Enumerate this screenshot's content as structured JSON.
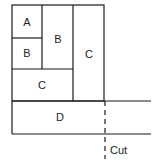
{
  "diagram": {
    "colors": {
      "line": "#1a1a1a",
      "background": "#ffffff"
    },
    "regions": [
      {
        "id": "A",
        "label": "A",
        "x": 12,
        "y": 5,
        "w": 30,
        "h": 33
      },
      {
        "id": "B1",
        "label": "B",
        "x": 12,
        "y": 38,
        "w": 30,
        "h": 31
      },
      {
        "id": "B2",
        "label": "B",
        "x": 42,
        "y": 5,
        "w": 31,
        "h": 64
      },
      {
        "id": "C1",
        "label": "C",
        "x": 12,
        "y": 69,
        "w": 61,
        "h": 32
      },
      {
        "id": "C2",
        "label": "C",
        "x": 73,
        "y": 5,
        "w": 31,
        "h": 96
      },
      {
        "id": "D",
        "label": "D",
        "x": 12,
        "y": 101,
        "w": 92,
        "h": 33
      }
    ],
    "cut_label": "Cut"
  }
}
